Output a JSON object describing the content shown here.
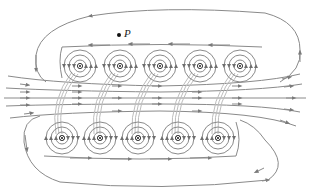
{
  "diagram": {
    "point_label": "P",
    "point_position": [
      119,
      35
    ],
    "colors": {
      "field_line": "#8a8a8a",
      "field_line_dark": "#6e6e6e",
      "loop_band": "#b9b9b9",
      "wire_symbol": "#222222",
      "background": "#ffffff"
    },
    "top_row": {
      "symbol": "dot",
      "meaning": "current out of page",
      "y": 66,
      "x": [
        80,
        120,
        160,
        200,
        240
      ]
    },
    "bottom_row": {
      "symbol": "cross",
      "meaning": "current into page",
      "y": 138,
      "x": [
        62,
        100,
        138,
        178,
        218
      ]
    },
    "interior_field_direction": "left-to-right",
    "outer_loop_direction": "right-to-left on top, left-to-right on bottom"
  }
}
